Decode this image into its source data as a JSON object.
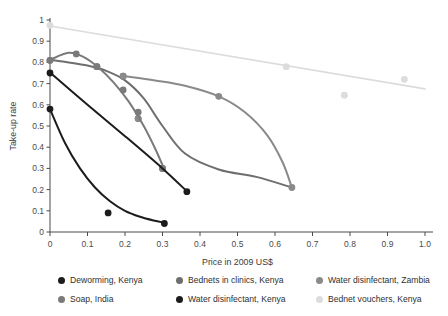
{
  "chart_data": {
    "type": "scatter",
    "title": "",
    "xlabel": "Price in 2009 US$",
    "ylabel": "Take-up rate",
    "xlim": [
      0,
      1.0
    ],
    "ylim": [
      0,
      1.0
    ],
    "xticks": [
      "0",
      "0.1",
      "0.2",
      "0.3",
      "0.4",
      "0.5",
      "0.6",
      "0.7",
      "0.8",
      "0.9",
      "1.0"
    ],
    "xtick_values": [
      0,
      0.1,
      0.2,
      0.3,
      0.4,
      0.5,
      0.6,
      0.7,
      0.8,
      0.9,
      1.0
    ],
    "yticks": [
      "0",
      "0.1",
      "0.2",
      "0.3",
      "0.4",
      "0.5",
      "0.6",
      "0.7",
      "0.8",
      "0.9",
      "1"
    ],
    "ytick_values": [
      0,
      0.1,
      0.2,
      0.3,
      0.4,
      0.5,
      0.6,
      0.7,
      0.8,
      0.9,
      1.0
    ],
    "grid": false,
    "legend_position": "below",
    "series": [
      {
        "name": "Deworming, Kenya",
        "color": "#1c1c1c",
        "points": [
          [
            0,
            0.58
          ],
          [
            0.155,
            0.09
          ],
          [
            0.305,
            0.04
          ]
        ],
        "fit": [
          [
            0,
            0.58
          ],
          [
            0.04,
            0.42
          ],
          [
            0.08,
            0.3
          ],
          [
            0.12,
            0.21
          ],
          [
            0.16,
            0.145
          ],
          [
            0.2,
            0.1
          ],
          [
            0.24,
            0.072
          ],
          [
            0.28,
            0.053
          ],
          [
            0.305,
            0.044
          ]
        ]
      },
      {
        "name": "Soap, India",
        "color": "#7a7a7a",
        "points": [
          [
            0,
            0.81
          ],
          [
            0.07,
            0.84
          ],
          [
            0.125,
            0.78
          ],
          [
            0.195,
            0.67
          ],
          [
            0.235,
            0.565
          ],
          [
            0.3,
            0.3
          ]
        ],
        "fit": [
          [
            0,
            0.812
          ],
          [
            0.05,
            0.845
          ],
          [
            0.09,
            0.825
          ],
          [
            0.13,
            0.775
          ],
          [
            0.17,
            0.705
          ],
          [
            0.21,
            0.615
          ],
          [
            0.25,
            0.5
          ],
          [
            0.28,
            0.395
          ],
          [
            0.305,
            0.295
          ]
        ]
      },
      {
        "name": "Bednets in clinics, Kenya",
        "color": "#6e6e6e",
        "points": [
          [
            0,
            0.81
          ],
          [
            0.125,
            0.78
          ],
          [
            0.195,
            0.735
          ],
          [
            0.235,
            0.535
          ],
          [
            0.3,
            0.3
          ]
        ],
        "fit": [
          [
            0,
            0.812
          ],
          [
            0.05,
            0.8
          ],
          [
            0.1,
            0.785
          ],
          [
            0.15,
            0.76
          ],
          [
            0.2,
            0.715
          ],
          [
            0.25,
            0.63
          ],
          [
            0.3,
            0.5
          ],
          [
            0.36,
            0.37
          ],
          [
            0.45,
            0.295
          ],
          [
            0.55,
            0.26
          ],
          [
            0.645,
            0.21
          ]
        ]
      },
      {
        "name": "Water disinfectant, Kenya",
        "color": "#1c1c1c",
        "points": [
          [
            0,
            0.75
          ],
          [
            0.365,
            0.19
          ]
        ],
        "fit": [
          [
            0,
            0.752
          ],
          [
            0.1,
            0.6
          ],
          [
            0.2,
            0.452
          ],
          [
            0.3,
            0.3
          ],
          [
            0.365,
            0.192
          ]
        ]
      },
      {
        "name": "Water disinfectant, Zambia",
        "color": "#8a8a8a",
        "points": [
          [
            0.195,
            0.735
          ],
          [
            0.235,
            0.535
          ],
          [
            0.45,
            0.64
          ],
          [
            0.645,
            0.21
          ]
        ],
        "fit": [
          [
            0.2,
            0.735
          ],
          [
            0.28,
            0.715
          ],
          [
            0.36,
            0.69
          ],
          [
            0.45,
            0.64
          ],
          [
            0.52,
            0.565
          ],
          [
            0.58,
            0.455
          ],
          [
            0.62,
            0.33
          ],
          [
            0.645,
            0.21
          ]
        ]
      },
      {
        "name": "Bednet vouchers, Kenya",
        "color": "#dcdcdc",
        "points": [
          [
            0,
            0.975
          ],
          [
            0.63,
            0.78
          ],
          [
            0.785,
            0.645
          ],
          [
            0.945,
            0.72
          ]
        ],
        "fit": [
          [
            0,
            0.972
          ],
          [
            1.0,
            0.675
          ]
        ]
      }
    ],
    "extra_markers": [
      {
        "series": "Soap, India",
        "x": 0.07,
        "y": 0.84
      },
      {
        "series": "Soap, India",
        "x": 0.125,
        "y": 0.78
      },
      {
        "series": "Soap, India",
        "x": 0.195,
        "y": 0.67
      },
      {
        "series": "Soap, India",
        "x": 0.235,
        "y": 0.565
      },
      {
        "series": "Soap, India",
        "x": 0.3,
        "y": 0.3
      }
    ]
  },
  "axes": {
    "x_title": "Price in 2009 US$",
    "y_title": "Take-up rate"
  },
  "legend": {
    "items": [
      {
        "label": "Deworming, Kenya",
        "color": "#1c1c1c"
      },
      {
        "label": "Bednets in clinics, Kenya",
        "color": "#6e6e6e"
      },
      {
        "label": "Water disinfectant, Zambia",
        "color": "#8a8a8a"
      },
      {
        "label": "Soap, India",
        "color": "#7a7a7a"
      },
      {
        "label": "Water disinfectant, Kenya",
        "color": "#1c1c1c"
      },
      {
        "label": "Bednet vouchers, Kenya",
        "color": "#dcdcdc"
      }
    ]
  }
}
